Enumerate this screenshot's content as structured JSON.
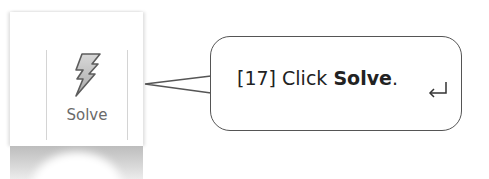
{
  "ribbon": {
    "solve_button": {
      "label": "Solve",
      "icon": "lightning-bolt-icon"
    }
  },
  "callout": {
    "step": "[17]",
    "text_prefix": "Click",
    "bold_text": "Solve",
    "suffix": ".",
    "icon": "return-arrow-icon",
    "border_color": "#555555"
  }
}
